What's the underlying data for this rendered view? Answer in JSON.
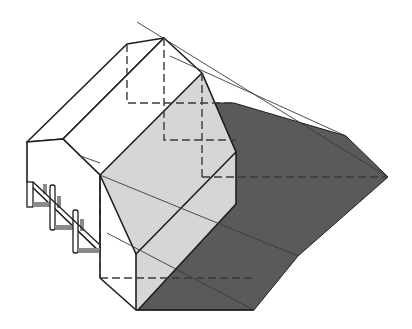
{
  "figure": {
    "title": "Shadow projection of a gabled house with porch",
    "colors": {
      "background": "#ffffff",
      "outline": "#1e1e1e",
      "light_face": "#d6d6d6",
      "shadow": "#5a5a5a",
      "porch_shadow": "#8a8a8a",
      "construction_line": "#3a3a3a"
    },
    "elements": [
      "roof",
      "front-gable-face",
      "left-wall",
      "porch-posts",
      "cast-shadow",
      "hidden-lines",
      "light-rays"
    ]
  }
}
